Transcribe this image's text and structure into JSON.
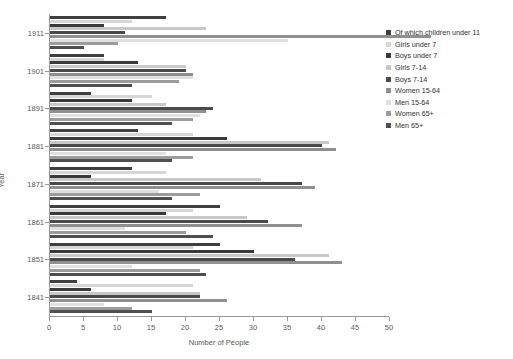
{
  "chart_data": {
    "type": "bar",
    "orientation": "horizontal",
    "title": "",
    "xlabel": "Number of People",
    "ylabel": "Year",
    "xlim": [
      0,
      50
    ],
    "ylim_categories": [
      "1841",
      "1851",
      "1861",
      "1871",
      "1881",
      "1891",
      "1901",
      "1911"
    ],
    "xticks": [
      0,
      5,
      10,
      15,
      20,
      25,
      30,
      35,
      40,
      45,
      50
    ],
    "grid": false,
    "legend_position": "right",
    "categories": [
      "1841",
      "1851",
      "1861",
      "1871",
      "1881",
      "1891",
      "1901",
      "1911"
    ],
    "series": [
      {
        "name": "Of which children under 11",
        "color": "#3f3f3f",
        "values": [
          4,
          25,
          25,
          12,
          13,
          6,
          8,
          17
        ]
      },
      {
        "name": "Girls under 7",
        "color": "#d6d6d6",
        "values": [
          21,
          21,
          21,
          17,
          21,
          15,
          8,
          12
        ]
      },
      {
        "name": "Boys under 7",
        "color": "#3a3a3a",
        "values": [
          6,
          30,
          17,
          6,
          26,
          12,
          13,
          8
        ]
      },
      {
        "name": "Girls 7-14",
        "color": "#c8c8c8",
        "values": [
          22,
          41,
          29,
          31,
          41,
          17,
          20,
          23
        ]
      },
      {
        "name": "Boys 7-14",
        "color": "#4a4a4a",
        "values": [
          22,
          36,
          32,
          37,
          40,
          24,
          20,
          11
        ]
      },
      {
        "name": "Women 15-64",
        "color": "#8f8f8f",
        "values": [
          26,
          43,
          37,
          39,
          42,
          23,
          21,
          56
        ]
      },
      {
        "name": "Men 15-64",
        "color": "#e0e0e0",
        "values": [
          8,
          12,
          11,
          16,
          17,
          22,
          21,
          35
        ]
      },
      {
        "name": "Women 65+",
        "color": "#9c9c9c",
        "values": [
          12,
          22,
          20,
          22,
          21,
          21,
          19,
          10
        ]
      },
      {
        "name": "Men 65+",
        "color": "#4f4f4f",
        "values": [
          15,
          23,
          24,
          18,
          18,
          18,
          12,
          5
        ]
      }
    ]
  },
  "legend": {
    "items": [
      {
        "label": "Of which children under 11",
        "swatch": "#3f3f3f"
      },
      {
        "label": "Girls under 7",
        "swatch": "#d6d6d6"
      },
      {
        "label": "Boys under 7",
        "swatch": "#3a3a3a"
      },
      {
        "label": "Girls 7-14",
        "swatch": "#c8c8c8"
      },
      {
        "label": "Boys 7-14",
        "swatch": "#4a4a4a"
      },
      {
        "label": "Women 15-64",
        "swatch": "#8f8f8f"
      },
      {
        "label": "Men 15-64",
        "swatch": "#e0e0e0"
      },
      {
        "label": "Women 65+",
        "swatch": "#9c9c9c"
      },
      {
        "label": "Men 65+",
        "swatch": "#4f4f4f"
      }
    ]
  },
  "axes": {
    "x_title": "Number of People",
    "y_title": "Year",
    "x_tick_labels": [
      "0",
      "5",
      "10",
      "15",
      "20",
      "25",
      "30",
      "35",
      "40",
      "45",
      "50"
    ],
    "y_tick_labels": [
      "1911",
      "1901",
      "1891",
      "1881",
      "1871",
      "1861",
      "1851",
      "1841"
    ]
  }
}
